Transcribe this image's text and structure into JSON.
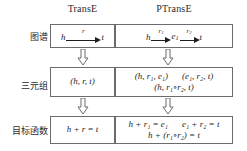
{
  "columns": {
    "left_header": "TransE",
    "right_header": "PTransE"
  },
  "row_labels": {
    "graph": "图谱",
    "triple": "三元组",
    "objective": "目标函数"
  },
  "graph_row": {
    "transe": {
      "head": "h",
      "relation": "r",
      "tail": "t"
    },
    "ptranse": {
      "head": "h",
      "relation1": "r",
      "relation1_sub": "1",
      "middle": "e",
      "middle_sub": "1",
      "relation2": "r",
      "relation2_sub": "2",
      "tail": "t"
    }
  },
  "triple_row": {
    "transe": "(h, r, t)",
    "ptranse_line1_a": "(h, r₁, e₁)",
    "ptranse_line1_b": "(e₁, r₂, t)",
    "ptranse_line2": "(h, r₁∘r₂, t)"
  },
  "objective_row": {
    "transe": "h + r = t",
    "ptranse_line1_a": "h + r₁ = e₁",
    "ptranse_line1_b": "e₁ + r₂ = t",
    "ptranse_line2": "h + (r₁∘r₂) = t"
  },
  "icons": {
    "down_block_arrow": "down-block-arrow",
    "right_arrow": "right-arrow"
  },
  "colors": {
    "border": "#6b6b6b",
    "text": "#1e1e1e",
    "background": "#ffffff"
  }
}
